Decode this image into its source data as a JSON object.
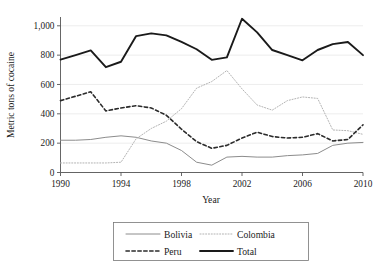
{
  "chart_data": {
    "type": "line",
    "title": "",
    "xlabel": "Year",
    "ylabel": "Metric tons of cocaine",
    "xlim": [
      1990,
      2010
    ],
    "ylim": [
      0,
      1060
    ],
    "xticks": [
      1990,
      1994,
      1998,
      2002,
      2006,
      2010
    ],
    "xticklabels": [
      "1990",
      "1994",
      "1998",
      "2002",
      "2006",
      "2010"
    ],
    "yticks": [
      0,
      200,
      400,
      600,
      800,
      1000
    ],
    "yticklabels": [
      "0",
      "200",
      "400",
      "600",
      "800",
      "1,000"
    ],
    "grid": "horizontal",
    "legend_position": "below-center",
    "x": [
      1990,
      1991,
      1992,
      1993,
      1994,
      1995,
      1996,
      1997,
      1998,
      1999,
      2000,
      2001,
      2002,
      2003,
      2004,
      2005,
      2006,
      2007,
      2008,
      2009,
      2010
    ],
    "series": [
      {
        "name": "Bolivia",
        "style": "solid",
        "color": "#8c8c8c",
        "width": 1.0,
        "values": [
          220,
          220,
          225,
          240,
          250,
          240,
          215,
          200,
          150,
          70,
          50,
          105,
          110,
          105,
          105,
          115,
          120,
          130,
          185,
          200,
          205
        ]
      },
      {
        "name": "Colombia",
        "style": "dotted",
        "color": "#b3b3b3",
        "width": 1.0,
        "values": [
          65,
          65,
          65,
          65,
          70,
          230,
          300,
          350,
          435,
          575,
          620,
          695,
          570,
          460,
          425,
          490,
          515,
          505,
          290,
          285,
          260
        ]
      },
      {
        "name": "Peru",
        "style": "dashed",
        "color": "#2b2b2b",
        "width": 1.6,
        "values": [
          490,
          520,
          550,
          420,
          440,
          455,
          440,
          390,
          295,
          210,
          165,
          185,
          235,
          275,
          245,
          235,
          240,
          265,
          215,
          225,
          325
        ]
      },
      {
        "name": "Total",
        "style": "solid",
        "color": "#1a1a1a",
        "width": 1.9,
        "values": [
          770,
          800,
          832,
          718,
          755,
          930,
          948,
          935,
          890,
          840,
          768,
          785,
          1048,
          955,
          835,
          800,
          765,
          835,
          875,
          890,
          800
        ]
      }
    ]
  },
  "axes": {
    "y_title": "Metric tons of cocaine",
    "x_title": "Year",
    "y_labels": [
      "1,000",
      "800",
      "600",
      "400",
      "200",
      "0"
    ],
    "x_labels": [
      "1990",
      "1994",
      "1998",
      "2002",
      "2006",
      "2010"
    ]
  },
  "legend": {
    "items": [
      {
        "label": "Bolivia"
      },
      {
        "label": "Colombia"
      },
      {
        "label": "Peru"
      },
      {
        "label": "Total"
      }
    ]
  }
}
